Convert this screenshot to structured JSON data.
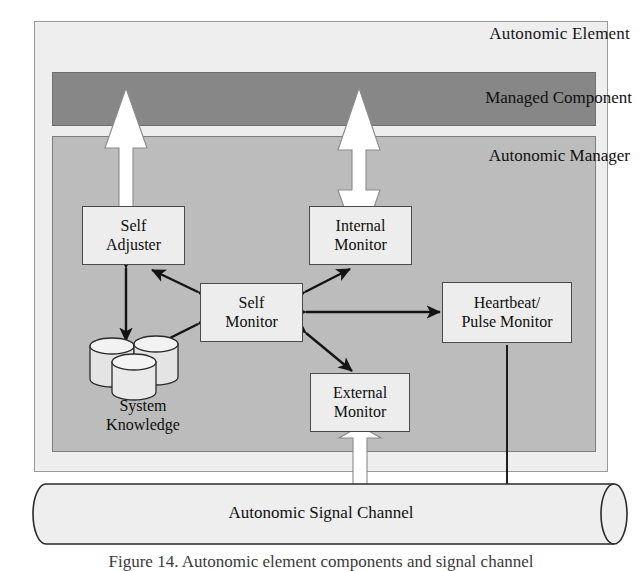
{
  "figure": {
    "caption": "Figure 14. Autonomic element components and signal channel"
  },
  "diagram": {
    "type": "block-diagram",
    "containers": [
      {
        "id": "autonomic-element",
        "label": "Autonomic Element",
        "fill": "#eeeeee"
      },
      {
        "id": "managed-component",
        "label": "Managed Component",
        "fill": "#878787"
      },
      {
        "id": "autonomic-manager",
        "label": "Autonomic Manager",
        "fill": "#bcbcbc"
      }
    ],
    "nodes": [
      {
        "id": "self-adjuster",
        "line1": "Self",
        "line2": "Adjuster"
      },
      {
        "id": "internal-monitor",
        "line1": "Internal",
        "line2": "Monitor"
      },
      {
        "id": "self-monitor",
        "line1": "Self",
        "line2": "Monitor"
      },
      {
        "id": "heartbeat-monitor",
        "line1": "Heartbeat/",
        "line2": "Pulse Monitor"
      },
      {
        "id": "external-monitor",
        "line1": "External",
        "line2": "Monitor"
      },
      {
        "id": "system-knowledge",
        "line1": "System",
        "line2": "Knowledge"
      }
    ],
    "channel": {
      "id": "autonomic-signal-channel",
      "label": "Autonomic Signal Channel"
    },
    "edges": [
      {
        "from": "self-adjuster",
        "to": "managed-component",
        "style": "hollow-white",
        "direction": "up"
      },
      {
        "from": "managed-component",
        "to": "internal-monitor",
        "style": "hollow-white",
        "direction": "both"
      },
      {
        "from": "self-monitor",
        "to": "self-adjuster",
        "style": "solid-black",
        "direction": "both"
      },
      {
        "from": "self-monitor",
        "to": "internal-monitor",
        "style": "solid-black",
        "direction": "both"
      },
      {
        "from": "self-monitor",
        "to": "heartbeat-monitor",
        "style": "solid-black",
        "direction": "both"
      },
      {
        "from": "self-monitor",
        "to": "external-monitor",
        "style": "solid-black",
        "direction": "both"
      },
      {
        "from": "self-monitor",
        "to": "system-knowledge",
        "style": "solid-black",
        "direction": "both"
      },
      {
        "from": "self-adjuster",
        "to": "system-knowledge",
        "style": "solid-black",
        "direction": "both"
      },
      {
        "from": "external-monitor",
        "to": "autonomic-signal-channel",
        "style": "hollow-white",
        "direction": "both"
      },
      {
        "from": "autonomic-signal-channel",
        "to": "heartbeat-monitor",
        "style": "solid-black",
        "direction": "up"
      }
    ]
  },
  "colors": {
    "element_fill": "#eeeeee",
    "managed_fill": "#878787",
    "manager_fill": "#bcbcbc",
    "node_fill": "#ededed",
    "stroke": "#141414"
  }
}
